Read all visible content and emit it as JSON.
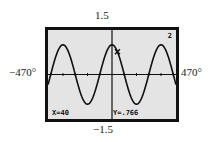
{
  "window": {
    "ymax_label": "1.5",
    "ymin_label": "−1.5",
    "xmin_label": "−470°",
    "xmax_label": "470°"
  },
  "screen": {
    "function_number": "2",
    "x_readout": "X=40",
    "y_readout": "Y=.766"
  },
  "chart_data": {
    "type": "line",
    "title": "",
    "xlabel": "",
    "ylabel": "",
    "xlim": [
      -470,
      470
    ],
    "ylim": [
      -1.5,
      1.5
    ],
    "grid": false,
    "x_unit": "degrees",
    "series": [
      {
        "name": "y = cos x",
        "function": "cos(x)",
        "x": [
          -470,
          -360,
          -270,
          -180,
          -90,
          0,
          90,
          180,
          270,
          360,
          470
        ],
        "values": [
          -0.342,
          1,
          0,
          -1,
          0,
          1,
          0,
          -1,
          0,
          1,
          -0.342
        ]
      }
    ],
    "trace_point": {
      "x": 40,
      "y": 0.766
    },
    "annotations": [
      "X=40",
      "Y=.766",
      "2"
    ]
  }
}
